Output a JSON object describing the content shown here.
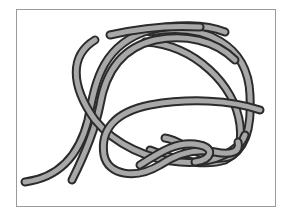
{
  "figure": {
    "colors": {
      "rope_fill": "#a8a8a8",
      "rope_outline": "#2b2b2b",
      "frame_border": "#9a9a9a",
      "background": "#ffffff"
    },
    "strands": [
      {
        "name": "outer-strand",
        "end": "left-tail"
      },
      {
        "name": "inner-strand",
        "end": "inner-tail"
      }
    ]
  }
}
